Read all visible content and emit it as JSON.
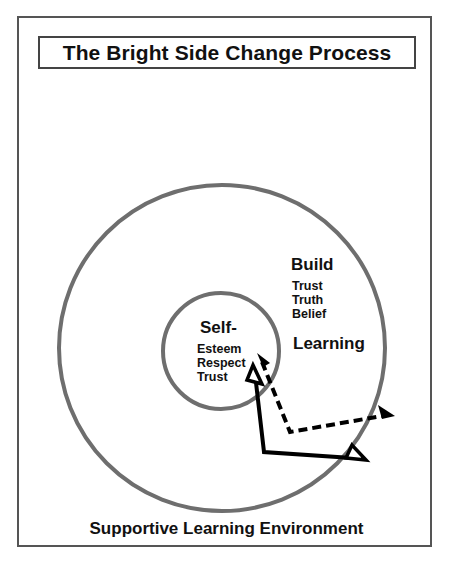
{
  "title": "The Bright Side Change Process",
  "inner_circle": {
    "heading": "Self-",
    "items": [
      "Esteem",
      "Respect",
      "Trust"
    ]
  },
  "outer_circle": {
    "heading": "Build",
    "items": [
      "Trust",
      "Truth",
      "Belief"
    ],
    "sub_heading": "Learning"
  },
  "footer": "Supportive Learning Environment",
  "arrows": [
    {
      "style": "solid",
      "description": "solid arrow from inner circle down then right"
    },
    {
      "style": "dashed",
      "description": "dashed arrow from inner circle down then right"
    }
  ],
  "colors": {
    "circle_stroke": "#6e6e6e",
    "arrow": "#000000",
    "frame": "#555555"
  }
}
